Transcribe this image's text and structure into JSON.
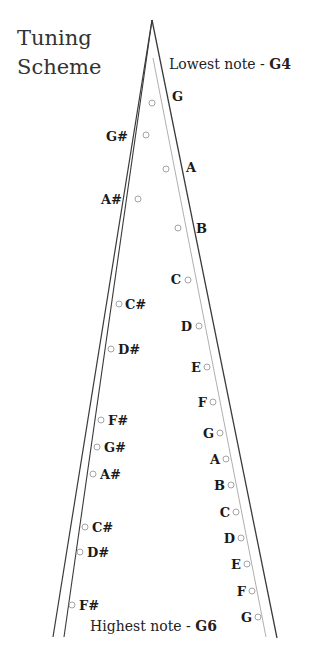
{
  "title": {
    "line1": "Tuning",
    "line2": "Scheme"
  },
  "lowest": {
    "prefix": "Lowest note - ",
    "note": "G4"
  },
  "highest": {
    "prefix": "Highest note - ",
    "note": "G6"
  },
  "colors": {
    "line_dark": "#3a3a3a",
    "line_light": "#9a9a9a",
    "text": "#1a1a1a",
    "pin_stroke": "#9a9a9a"
  },
  "frame": {
    "apex": [
      152,
      20
    ],
    "left_outer_end": [
      53,
      637
    ],
    "left_inner_end": [
      64,
      637
    ],
    "right_inner_start": [
      153,
      58
    ],
    "right_inner_end": [
      266,
      637
    ],
    "right_outer_end": [
      277,
      638
    ]
  },
  "pins": [
    {
      "note": "G",
      "side": "right",
      "x": 152,
      "y": 103,
      "lx": 172,
      "ly": 101,
      "anchor": "start"
    },
    {
      "note": "G#",
      "side": "left",
      "x": 146,
      "y": 135,
      "lx": 128,
      "ly": 141,
      "anchor": "end"
    },
    {
      "note": "A",
      "side": "right",
      "x": 166,
      "y": 169,
      "lx": 186,
      "ly": 172,
      "anchor": "start"
    },
    {
      "note": "A#",
      "side": "left",
      "x": 138,
      "y": 199,
      "lx": 122,
      "ly": 204,
      "anchor": "end"
    },
    {
      "note": "B",
      "side": "right",
      "x": 178,
      "y": 228,
      "lx": 196,
      "ly": 233,
      "anchor": "start"
    },
    {
      "note": "C",
      "side": "right",
      "x": 188,
      "y": 280,
      "lx": 181,
      "ly": 284,
      "anchor": "end"
    },
    {
      "note": "C#",
      "side": "left",
      "x": 119,
      "y": 304,
      "lx": 125,
      "ly": 309,
      "anchor": "start"
    },
    {
      "note": "D",
      "side": "right",
      "x": 199,
      "y": 326,
      "lx": 192,
      "ly": 331,
      "anchor": "end"
    },
    {
      "note": "D#",
      "side": "left",
      "x": 111,
      "y": 349,
      "lx": 118,
      "ly": 354,
      "anchor": "start"
    },
    {
      "note": "E",
      "side": "right",
      "x": 207,
      "y": 367,
      "lx": 201,
      "ly": 372,
      "anchor": "end"
    },
    {
      "note": "F",
      "side": "right",
      "x": 213,
      "y": 402,
      "lx": 207,
      "ly": 407,
      "anchor": "end"
    },
    {
      "note": "F#",
      "side": "left",
      "x": 101,
      "y": 420,
      "lx": 108,
      "ly": 425,
      "anchor": "start"
    },
    {
      "note": "G",
      "side": "right",
      "x": 220,
      "y": 433,
      "lx": 214,
      "ly": 438,
      "anchor": "end"
    },
    {
      "note": "G#",
      "side": "left",
      "x": 97,
      "y": 447,
      "lx": 104,
      "ly": 452,
      "anchor": "start"
    },
    {
      "note": "A",
      "side": "right",
      "x": 226,
      "y": 459,
      "lx": 220,
      "ly": 464,
      "anchor": "end"
    },
    {
      "note": "A#",
      "side": "left",
      "x": 93,
      "y": 474,
      "lx": 100,
      "ly": 479,
      "anchor": "start"
    },
    {
      "note": "B",
      "side": "right",
      "x": 231,
      "y": 485,
      "lx": 225,
      "ly": 490,
      "anchor": "end"
    },
    {
      "note": "C",
      "side": "right",
      "x": 236,
      "y": 512,
      "lx": 230,
      "ly": 517,
      "anchor": "end"
    },
    {
      "note": "C#",
      "side": "left",
      "x": 85,
      "y": 527,
      "lx": 92,
      "ly": 532,
      "anchor": "start"
    },
    {
      "note": "D",
      "side": "right",
      "x": 241,
      "y": 538,
      "lx": 235,
      "ly": 543,
      "anchor": "end"
    },
    {
      "note": "D#",
      "side": "left",
      "x": 80,
      "y": 552,
      "lx": 87,
      "ly": 557,
      "anchor": "start"
    },
    {
      "note": "E",
      "side": "right",
      "x": 247,
      "y": 564,
      "lx": 241,
      "ly": 569,
      "anchor": "end"
    },
    {
      "note": "F",
      "side": "right",
      "x": 252,
      "y": 591,
      "lx": 246,
      "ly": 596,
      "anchor": "end"
    },
    {
      "note": "F#",
      "side": "left",
      "x": 72,
      "y": 605,
      "lx": 79,
      "ly": 610,
      "anchor": "start"
    },
    {
      "note": "G",
      "side": "right",
      "x": 258,
      "y": 617,
      "lx": 252,
      "ly": 622,
      "anchor": "end"
    }
  ]
}
